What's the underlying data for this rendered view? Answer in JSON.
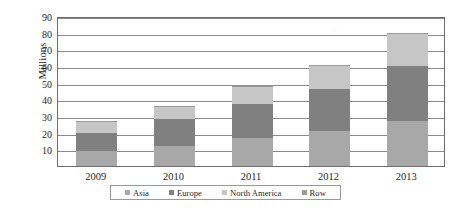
{
  "chart_data": {
    "type": "bar",
    "stacked": true,
    "title": "",
    "subtitle": "",
    "xlabel": "",
    "ylabel": "Millions",
    "categories": [
      "2009",
      "2010",
      "2011",
      "2012",
      "2013"
    ],
    "ylim": [
      0,
      90
    ],
    "yticks": [
      10,
      20,
      30,
      40,
      50,
      60,
      70,
      80,
      90
    ],
    "ytick_labels": [
      "10",
      "20",
      "30",
      "40",
      "50",
      "60",
      "70",
      "80",
      "90"
    ],
    "grid": true,
    "legend_position": "bottom",
    "series": [
      {
        "name": "Asia",
        "color": "#a8a8a8",
        "values": [
          9,
          12,
          17,
          21,
          27
        ]
      },
      {
        "name": "Europe",
        "color": "#808080",
        "values": [
          11,
          16,
          20,
          25,
          33
        ]
      },
      {
        "name": "North America",
        "color": "#c6c6c6",
        "values": [
          7,
          7.5,
          10.5,
          14.5,
          19
        ]
      },
      {
        "name": "Row",
        "color": "#9a9a9a",
        "values": [
          0.3,
          0.3,
          0.4,
          0.4,
          1
        ]
      }
    ],
    "totals": [
      27.3,
      35.8,
      47.9,
      60.9,
      80
    ]
  },
  "legend": {
    "items": [
      {
        "label": "Asia",
        "color": "#a8a8a8"
      },
      {
        "label": "Europe",
        "color": "#808080"
      },
      {
        "label": "North America",
        "color": "#c6c6c6"
      },
      {
        "label": "Row",
        "color": "#9a9a9a"
      }
    ]
  },
  "axis": {
    "y_title": "Millions"
  },
  "style": {
    "axis_line": "#6d6d6d",
    "gridline": "#8a8a8a",
    "background": "#ffffff",
    "text": "#1f1f1f"
  }
}
